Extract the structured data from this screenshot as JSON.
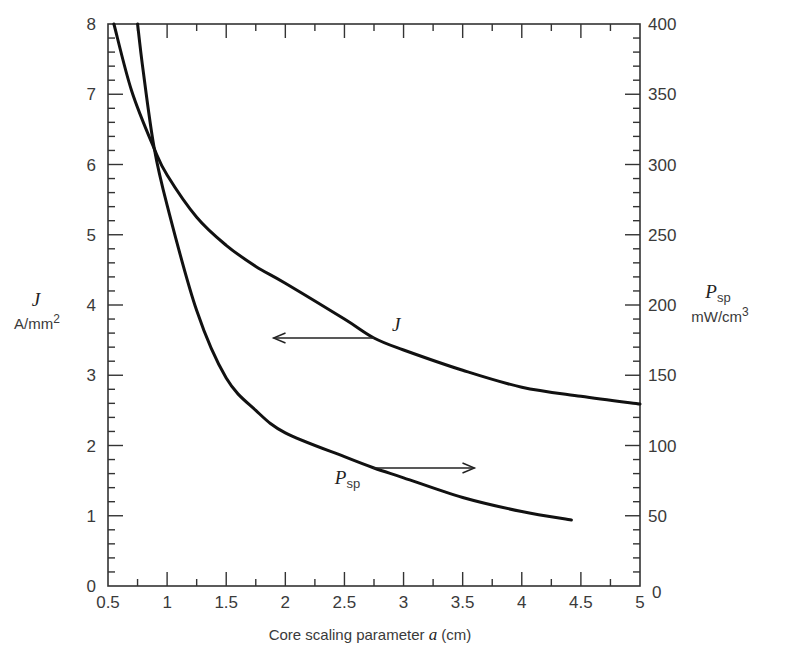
{
  "chart_data": {
    "type": "line",
    "title": "",
    "xlabel": "Core scaling parameter a (cm)",
    "xlabel_prefix": "Core scaling parameter ",
    "xlabel_var": "a",
    "xlabel_suffix": " (cm)",
    "xlim": [
      0.5,
      5
    ],
    "xticks": [
      0.5,
      1,
      1.5,
      2,
      2.5,
      3,
      3.5,
      4,
      4.5,
      5
    ],
    "xtick_labels": [
      "0.5",
      "1",
      "1.5",
      "2",
      "2.5",
      "3",
      "3.5",
      "4",
      "4.5",
      "5"
    ],
    "y_left": {
      "label_var": "J",
      "label_unit": "A/mm",
      "label_unit_sup": "2",
      "ylim": [
        0,
        8
      ],
      "ticks": [
        0,
        1,
        2,
        3,
        4,
        5,
        6,
        7,
        8
      ],
      "tick_labels": [
        "0",
        "1",
        "2",
        "3",
        "4",
        "5",
        "6",
        "7",
        "8"
      ]
    },
    "y_right": {
      "label_var": "P",
      "label_sub": "sp",
      "label_unit": "mW/cm",
      "label_unit_sup": "3",
      "ylim": [
        0,
        400
      ],
      "ticks": [
        0,
        50,
        100,
        150,
        200,
        250,
        300,
        350,
        400
      ],
      "tick_labels": [
        "0",
        "50",
        "100",
        "150",
        "200",
        "250",
        "300",
        "350",
        "400"
      ]
    },
    "grid": false,
    "legend": "none (inline annotations with arrows)",
    "series": [
      {
        "name": "J",
        "axis": "left",
        "unit": "A/mm^2",
        "x": [
          0.55,
          0.7,
          0.89,
          1.0,
          1.25,
          1.5,
          1.75,
          2.0,
          2.5,
          2.75,
          3.0,
          3.5,
          4.0,
          4.5,
          5.0
        ],
        "y": [
          8.0,
          7.05,
          6.23,
          5.85,
          5.25,
          4.85,
          4.55,
          4.31,
          3.8,
          3.53,
          3.36,
          3.07,
          2.83,
          2.7,
          2.59
        ]
      },
      {
        "name": "P_sp",
        "axis": "right",
        "unit": "mW/cm^3",
        "x": [
          0.75,
          0.8,
          0.89,
          1.0,
          1.25,
          1.5,
          1.75,
          2.0,
          2.5,
          2.75,
          3.0,
          3.5,
          4.0,
          4.42
        ],
        "y": [
          400,
          365,
          312,
          271,
          196,
          148,
          125,
          109,
          92,
          84,
          77,
          63,
          53,
          47
        ]
      }
    ],
    "annotations": [
      {
        "label": "J",
        "label_var": "J",
        "arrow_from_x": 2.75,
        "arrow_to_x": 1.9,
        "arrow_y_left": 3.53,
        "direction": "left"
      },
      {
        "label": "P_sp",
        "label_var": "P",
        "label_sub": "sp",
        "arrow_from_x": 2.74,
        "arrow_to_x": 3.6,
        "arrow_y_right": 84,
        "direction": "right"
      }
    ]
  }
}
